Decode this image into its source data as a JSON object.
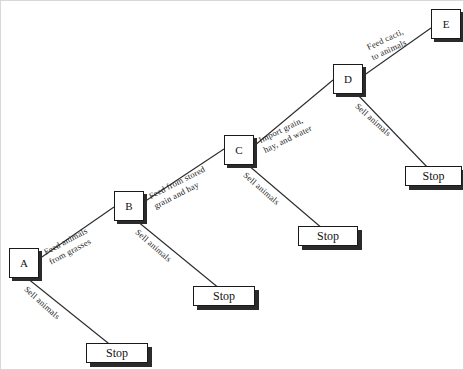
{
  "diagram": {
    "type": "decision-tree",
    "title": "",
    "background": "#ffffff",
    "line_color": "#2b2b2b",
    "decision_nodes": [
      {
        "id": "A",
        "label": "A",
        "x": 8,
        "y": 247
      },
      {
        "id": "B",
        "label": "B",
        "x": 113,
        "y": 190
      },
      {
        "id": "C",
        "label": "C",
        "x": 223,
        "y": 134
      },
      {
        "id": "D",
        "label": "D",
        "x": 332,
        "y": 63
      },
      {
        "id": "E",
        "label": "E",
        "x": 430,
        "y": 8
      }
    ],
    "terminal_nodes": [
      {
        "id": "stop1",
        "label": "Stop",
        "x": 85,
        "y": 342,
        "w": 62
      },
      {
        "id": "stop2",
        "label": "Stop",
        "x": 192,
        "y": 285,
        "w": 62
      },
      {
        "id": "stop3",
        "label": "Stop",
        "x": 297,
        "y": 225,
        "w": 60
      },
      {
        "id": "stop4",
        "label": "Stop",
        "x": 404,
        "y": 165,
        "w": 57
      }
    ],
    "edges": [
      {
        "id": "a-b",
        "from": "A",
        "to": "B",
        "line1": "Feed animals",
        "line2": "from grasses",
        "lx": 41,
        "ly": 247,
        "angle": -28
      },
      {
        "id": "a-stop1",
        "from": "A",
        "to": "stop1",
        "line1": "Sell animals",
        "line2": "",
        "lx": 28,
        "ly": 283,
        "angle": 42
      },
      {
        "id": "b-c",
        "from": "B",
        "to": "C",
        "line1": "Feed from stored",
        "line2": "grain and hay",
        "lx": 146,
        "ly": 191,
        "angle": -27
      },
      {
        "id": "b-stop2",
        "from": "B",
        "to": "stop2",
        "line1": "Sell animals",
        "line2": "",
        "lx": 139,
        "ly": 226,
        "angle": 41
      },
      {
        "id": "c-d",
        "from": "C",
        "to": "D",
        "line1": "Import grain,",
        "line2": "hay, and water",
        "lx": 256,
        "ly": 135,
        "angle": -26
      },
      {
        "id": "c-stop3",
        "from": "C",
        "to": "stop3",
        "line1": "Sell animals",
        "line2": "",
        "lx": 247,
        "ly": 169,
        "angle": 41
      },
      {
        "id": "d-e",
        "from": "D",
        "to": "E",
        "line1": "Feed cacti,",
        "line2": "to animals",
        "lx": 364,
        "ly": 42,
        "angle": -25
      },
      {
        "id": "d-stop4",
        "from": "D",
        "to": "stop4",
        "line1": "Sell animals",
        "line2": "",
        "lx": 359,
        "ly": 100,
        "angle": 42
      }
    ],
    "connectors": [
      {
        "id": "line-a-b",
        "x1": 38,
        "y1": 258,
        "x2": 113,
        "y2": 206
      },
      {
        "id": "line-a-stop1",
        "x1": 26,
        "y1": 277,
        "x2": 112,
        "y2": 346
      },
      {
        "id": "line-b-c",
        "x1": 143,
        "y1": 201,
        "x2": 223,
        "y2": 148
      },
      {
        "id": "line-b-stop2",
        "x1": 136,
        "y1": 220,
        "x2": 219,
        "y2": 288
      },
      {
        "id": "line-c-d",
        "x1": 253,
        "y1": 145,
        "x2": 332,
        "y2": 79
      },
      {
        "id": "line-c-stop3",
        "x1": 247,
        "y1": 164,
        "x2": 322,
        "y2": 228
      },
      {
        "id": "line-d-e",
        "x1": 362,
        "y1": 75,
        "x2": 430,
        "y2": 27
      },
      {
        "id": "line-d-stop4",
        "x1": 356,
        "y1": 93,
        "x2": 428,
        "y2": 168
      }
    ]
  }
}
